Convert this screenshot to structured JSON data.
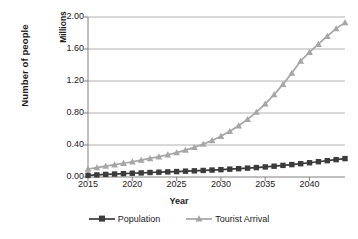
{
  "chart_data": {
    "type": "line",
    "title": "",
    "xlabel": "Year",
    "ylabel": "Number of people",
    "y_unit_label": "Millions",
    "xlim": [
      2015,
      2044
    ],
    "ylim": [
      0.0,
      2.0
    ],
    "grid": true,
    "grid_axis": "y",
    "legend_position": "bottom",
    "x": [
      2015,
      2016,
      2017,
      2018,
      2019,
      2020,
      2021,
      2022,
      2023,
      2024,
      2025,
      2026,
      2027,
      2028,
      2029,
      2030,
      2031,
      2032,
      2033,
      2034,
      2035,
      2036,
      2037,
      2038,
      2039,
      2040,
      2041,
      2042,
      2043,
      2044
    ],
    "xticks": [
      2015,
      2020,
      2025,
      2030,
      2035,
      2040
    ],
    "yticks": [
      0.0,
      0.4,
      0.8,
      1.2,
      1.6,
      2.0
    ],
    "ytick_labels": [
      "0.00",
      "0.40",
      "0.80",
      "1.20",
      "1.60",
      "2.00"
    ],
    "xtick_labels": [
      "2015",
      "2020",
      "2025",
      "2030",
      "2035",
      "2040"
    ],
    "series": [
      {
        "name": "Population",
        "color": "#3b3b3b",
        "marker": "square",
        "values": [
          0.02,
          0.026,
          0.032,
          0.037,
          0.042,
          0.047,
          0.051,
          0.056,
          0.06,
          0.064,
          0.068,
          0.073,
          0.077,
          0.082,
          0.087,
          0.092,
          0.098,
          0.104,
          0.111,
          0.118,
          0.126,
          0.135,
          0.145,
          0.155,
          0.166,
          0.178,
          0.191,
          0.204,
          0.217,
          0.23
        ]
      },
      {
        "name": "Tourist Arrival",
        "color": "#a6a6a6",
        "marker": "triangle",
        "values": [
          0.1,
          0.118,
          0.136,
          0.154,
          0.172,
          0.191,
          0.211,
          0.232,
          0.254,
          0.278,
          0.305,
          0.336,
          0.371,
          0.411,
          0.457,
          0.51,
          0.571,
          0.641,
          0.721,
          0.812,
          0.915,
          1.03,
          1.158,
          1.299,
          1.45,
          1.56,
          1.66,
          1.76,
          1.855,
          1.93
        ]
      }
    ]
  },
  "legend": [
    {
      "label": "Population"
    },
    {
      "label": "Tourist Arrival"
    }
  ]
}
